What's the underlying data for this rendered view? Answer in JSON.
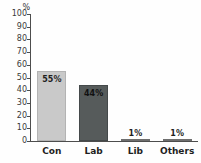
{
  "chart_data": {
    "type": "bar",
    "title": "",
    "xlabel": "",
    "ylabel": "%",
    "unit_label": "%",
    "categories": [
      "Con",
      "Lab",
      "Lib",
      "Others"
    ],
    "values": [
      55,
      44,
      1,
      1
    ],
    "data_labels": [
      "55%",
      "44%",
      "1%",
      "1%"
    ],
    "ylim": [
      0,
      100
    ],
    "yticks": [
      100,
      90,
      80,
      70,
      60,
      50,
      40,
      30,
      20,
      10,
      0
    ],
    "ytick_labels": [
      "100",
      "90",
      "80",
      "70",
      "60",
      "50",
      "40",
      "30",
      "20",
      "10",
      "0"
    ],
    "grid": false,
    "legend": false,
    "bar_colors": [
      "#c9c9c9",
      "#565b5b",
      "#7d7d7d",
      "#7d7d7d"
    ],
    "bar_border_colors": [
      "#b3b3b3",
      "#44494a",
      "#6e6e6e",
      "#6e6e6e"
    ],
    "axis_color": "#4d4d4d",
    "background_color": "#fefefe",
    "label_positions": [
      "inside",
      "inside",
      "above",
      "above"
    ]
  }
}
